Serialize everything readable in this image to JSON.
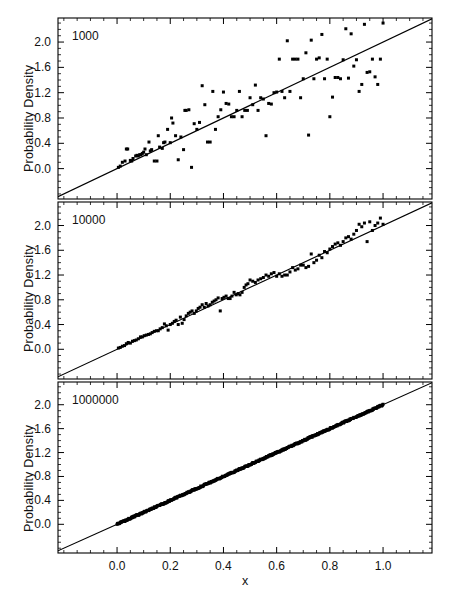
{
  "figure": {
    "width": 457,
    "height": 598,
    "background": "#ffffff",
    "ink": "#000000",
    "xlabel": "x",
    "ylabel": "Probability Density"
  },
  "chart_data": [
    {
      "type": "scatter",
      "title": "",
      "panel_label": "1000",
      "xlabel": "x",
      "ylabel": "Probability Density",
      "xlim": [
        -0.222,
        1.184
      ],
      "ylim": [
        -0.48,
        2.38
      ],
      "xticks": [
        0.0,
        0.2,
        0.4,
        0.6,
        0.8,
        1.0
      ],
      "xticklabels": [
        "0.0",
        "0.2",
        "0.4",
        "0.6",
        "0.8",
        "1.0"
      ],
      "yticks": [
        0.0,
        0.4,
        0.8,
        1.2,
        1.6,
        2.0
      ],
      "yticklabels": [
        "0.0",
        "0.4",
        "0.8",
        "1.2",
        "1.6",
        "2.0"
      ],
      "minor_tick_step_x": 0.05,
      "minor_tick_step_y": 0.1,
      "grid": false,
      "legend": "none",
      "reference_line": {
        "slope": 2.0,
        "intercept": 0.0,
        "label": "y = 2x"
      },
      "x": [
        0.005,
        0.012,
        0.02,
        0.03,
        0.035,
        0.04,
        0.05,
        0.055,
        0.06,
        0.07,
        0.075,
        0.08,
        0.085,
        0.09,
        0.095,
        0.1,
        0.105,
        0.11,
        0.12,
        0.125,
        0.13,
        0.14,
        0.15,
        0.155,
        0.16,
        0.17,
        0.175,
        0.18,
        0.19,
        0.2,
        0.205,
        0.21,
        0.22,
        0.23,
        0.24,
        0.25,
        0.255,
        0.26,
        0.27,
        0.28,
        0.29,
        0.3,
        0.31,
        0.32,
        0.33,
        0.34,
        0.35,
        0.36,
        0.37,
        0.38,
        0.39,
        0.4,
        0.41,
        0.42,
        0.43,
        0.44,
        0.45,
        0.46,
        0.47,
        0.48,
        0.49,
        0.5,
        0.51,
        0.52,
        0.53,
        0.54,
        0.55,
        0.56,
        0.57,
        0.58,
        0.59,
        0.6,
        0.61,
        0.62,
        0.63,
        0.64,
        0.65,
        0.66,
        0.67,
        0.68,
        0.69,
        0.7,
        0.71,
        0.72,
        0.73,
        0.74,
        0.75,
        0.76,
        0.77,
        0.78,
        0.79,
        0.8,
        0.81,
        0.82,
        0.83,
        0.84,
        0.85,
        0.86,
        0.87,
        0.88,
        0.89,
        0.9,
        0.91,
        0.92,
        0.93,
        0.94,
        0.95,
        0.96,
        0.97,
        0.98,
        0.99,
        1.0
      ],
      "y": [
        0.02,
        0.04,
        0.1,
        0.12,
        0.31,
        0.31,
        0.13,
        0.12,
        0.16,
        0.2,
        0.21,
        0.2,
        0.22,
        0.22,
        0.24,
        0.26,
        0.31,
        0.22,
        0.42,
        0.28,
        0.3,
        0.12,
        0.12,
        0.52,
        0.34,
        0.32,
        0.41,
        0.42,
        0.62,
        0.41,
        0.8,
        0.72,
        0.52,
        0.14,
        0.5,
        0.3,
        0.92,
        0.92,
        0.93,
        0.02,
        0.71,
        0.62,
        0.73,
        1.31,
        1.01,
        0.42,
        0.42,
        1.22,
        0.62,
        0.82,
        0.93,
        1.21,
        1.03,
        1.02,
        0.82,
        0.82,
        0.92,
        1.22,
        0.82,
        0.92,
        0.92,
        1.12,
        1.01,
        1.32,
        0.92,
        1.12,
        1.1,
        0.52,
        1.03,
        1.02,
        1.2,
        1.21,
        1.73,
        1.22,
        1.12,
        2.02,
        1.22,
        1.73,
        1.73,
        1.73,
        1.12,
        1.42,
        1.83,
        0.53,
        2.03,
        1.42,
        1.73,
        1.75,
        2.12,
        1.42,
        1.73,
        0.82,
        1.13,
        1.44,
        1.44,
        1.42,
        1.72,
        2.21,
        1.43,
        2.13,
        1.62,
        1.72,
        1.22,
        1.33,
        2.28,
        1.52,
        1.53,
        1.73,
        1.45,
        1.33,
        1.73,
        2.3
      ],
      "marker": "filled-square",
      "marker_size_px": 3,
      "n_samples": 1000
    },
    {
      "type": "scatter",
      "title": "",
      "panel_label": "10000",
      "xlabel": "x",
      "ylabel": "Probability Density",
      "xlim": [
        -0.222,
        1.184
      ],
      "ylim": [
        -0.48,
        2.38
      ],
      "xticks": [
        0.0,
        0.2,
        0.4,
        0.6,
        0.8,
        1.0
      ],
      "xticklabels": [
        "0.0",
        "0.2",
        "0.4",
        "0.6",
        "0.8",
        "1.0"
      ],
      "yticks": [
        0.0,
        0.4,
        0.8,
        1.2,
        1.6,
        2.0
      ],
      "yticklabels": [
        "0.0",
        "0.4",
        "0.8",
        "1.2",
        "1.6",
        "2.0"
      ],
      "minor_tick_step_x": 0.05,
      "minor_tick_step_y": 0.1,
      "grid": false,
      "legend": "none",
      "reference_line": {
        "slope": 2.0,
        "intercept": 0.0,
        "label": "y = 2x"
      },
      "x": [
        0.005,
        0.012,
        0.02,
        0.028,
        0.035,
        0.042,
        0.05,
        0.058,
        0.065,
        0.072,
        0.08,
        0.088,
        0.095,
        0.102,
        0.11,
        0.118,
        0.125,
        0.132,
        0.14,
        0.148,
        0.155,
        0.162,
        0.17,
        0.178,
        0.185,
        0.192,
        0.2,
        0.208,
        0.215,
        0.222,
        0.23,
        0.238,
        0.245,
        0.252,
        0.26,
        0.268,
        0.275,
        0.282,
        0.29,
        0.298,
        0.305,
        0.312,
        0.32,
        0.328,
        0.335,
        0.342,
        0.35,
        0.358,
        0.365,
        0.372,
        0.38,
        0.388,
        0.395,
        0.402,
        0.41,
        0.418,
        0.425,
        0.432,
        0.44,
        0.448,
        0.455,
        0.462,
        0.47,
        0.478,
        0.485,
        0.492,
        0.5,
        0.51,
        0.52,
        0.53,
        0.54,
        0.55,
        0.56,
        0.57,
        0.58,
        0.59,
        0.6,
        0.61,
        0.62,
        0.63,
        0.64,
        0.65,
        0.66,
        0.67,
        0.68,
        0.69,
        0.7,
        0.71,
        0.72,
        0.73,
        0.74,
        0.75,
        0.76,
        0.77,
        0.78,
        0.79,
        0.8,
        0.81,
        0.82,
        0.83,
        0.84,
        0.85,
        0.86,
        0.87,
        0.88,
        0.89,
        0.9,
        0.91,
        0.92,
        0.93,
        0.94,
        0.95,
        0.96,
        0.97,
        0.98,
        0.99,
        1.0
      ],
      "y": [
        0.02,
        0.03,
        0.05,
        0.06,
        0.09,
        0.11,
        0.1,
        0.13,
        0.14,
        0.15,
        0.17,
        0.2,
        0.2,
        0.22,
        0.23,
        0.24,
        0.25,
        0.27,
        0.29,
        0.3,
        0.3,
        0.33,
        0.35,
        0.41,
        0.38,
        0.31,
        0.4,
        0.42,
        0.45,
        0.47,
        0.4,
        0.52,
        0.42,
        0.48,
        0.54,
        0.58,
        0.6,
        0.62,
        0.58,
        0.62,
        0.66,
        0.68,
        0.72,
        0.68,
        0.74,
        0.7,
        0.72,
        0.76,
        0.78,
        0.8,
        0.83,
        0.62,
        0.82,
        0.84,
        0.86,
        0.82,
        0.82,
        0.86,
        0.92,
        0.88,
        0.9,
        0.88,
        0.92,
        1.0,
        1.04,
        1.06,
        1.12,
        1.1,
        1.08,
        1.12,
        1.14,
        1.16,
        1.2,
        1.18,
        1.22,
        1.24,
        1.18,
        1.22,
        1.18,
        1.2,
        1.2,
        1.25,
        1.32,
        1.28,
        1.3,
        1.36,
        1.36,
        1.32,
        1.34,
        1.54,
        1.4,
        1.44,
        1.52,
        1.48,
        1.58,
        1.56,
        1.62,
        1.66,
        1.7,
        1.72,
        1.68,
        1.74,
        1.8,
        1.82,
        1.78,
        1.86,
        1.92,
        2.02,
        1.98,
        2.04,
        1.74,
        2.06,
        1.92,
        2.0,
        2.04,
        2.12,
        2.02
      ],
      "marker": "filled-square",
      "marker_size_px": 3,
      "n_samples": 10000
    },
    {
      "type": "scatter",
      "title": "",
      "panel_label": "1000000",
      "xlabel": "x",
      "ylabel": "Probability Density",
      "xlim": [
        -0.222,
        1.184
      ],
      "ylim": [
        -0.48,
        2.38
      ],
      "xticks": [
        0.0,
        0.2,
        0.4,
        0.6,
        0.8,
        1.0
      ],
      "xticklabels": [
        "0.0",
        "0.2",
        "0.4",
        "0.6",
        "0.8",
        "1.0"
      ],
      "yticks": [
        0.0,
        0.4,
        0.8,
        1.2,
        1.6,
        2.0
      ],
      "yticklabels": [
        "0.0",
        "0.4",
        "0.8",
        "1.2",
        "1.6",
        "2.0"
      ],
      "minor_tick_step_x": 0.05,
      "minor_tick_step_y": 0.1,
      "grid": false,
      "legend": "none",
      "reference_line": {
        "slope": 2.0,
        "intercept": 0.0,
        "label": "y = 2x"
      },
      "description": "Dense band of points lying essentially on the reference line y = 2x from x = 0 to x = 1.",
      "marker": "filled-square",
      "marker_size_px": 3,
      "n_samples": 1000000,
      "dense_band": {
        "x_start": 0.0,
        "x_end": 1.0,
        "n_points": 500,
        "jitter": 0.022
      }
    }
  ]
}
